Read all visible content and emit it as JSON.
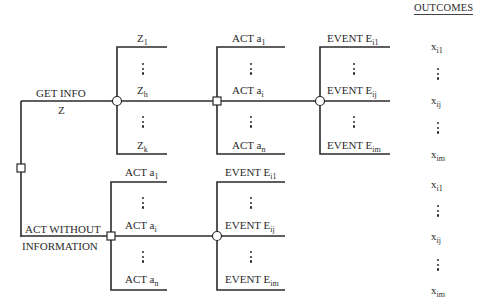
{
  "diagram": {
    "type": "decision-tree",
    "header": {
      "outcomes": "OUTCOMES"
    },
    "root_branches": {
      "get_info": {
        "label": "GET INFO",
        "sublabel": "Z"
      },
      "act_without_info": {
        "line1": "ACT WITHOUT",
        "line2": "INFORMATION"
      }
    },
    "info_outcomes": [
      {
        "base": "Z",
        "sub": "1"
      },
      {
        "base": "Z",
        "sub": "h"
      },
      {
        "base": "Z",
        "sub": "k"
      }
    ],
    "acts_top": [
      {
        "base": "ACT a",
        "sub": "1"
      },
      {
        "base": "ACT a",
        "sub": "i"
      },
      {
        "base": "ACT a",
        "sub": "n"
      }
    ],
    "events_top": [
      {
        "base": "EVENT E",
        "sub": "i1"
      },
      {
        "base": "EVENT E",
        "sub": "ij"
      },
      {
        "base": "EVENT E",
        "sub": "im"
      }
    ],
    "outcomes_top": [
      {
        "base": "x",
        "sub": "i1"
      },
      {
        "base": "x",
        "sub": "ij"
      },
      {
        "base": "x",
        "sub": "im"
      }
    ],
    "acts_bottom": [
      {
        "base": "ACT a",
        "sub": "1"
      },
      {
        "base": "ACT a",
        "sub": "i"
      },
      {
        "base": "ACT a",
        "sub": "n"
      }
    ],
    "events_bottom": [
      {
        "base": "EVENT E",
        "sub": "i1"
      },
      {
        "base": "EVENT E",
        "sub": "ij"
      },
      {
        "base": "EVENT E",
        "sub": "im"
      }
    ],
    "outcomes_bottom": [
      {
        "base": "x",
        "sub": "i1"
      },
      {
        "base": "x",
        "sub": "ij"
      },
      {
        "base": "x",
        "sub": "im"
      }
    ],
    "colors": {
      "line": "#2a2a2a",
      "node_fill": "#ffffff",
      "background": "#ffffff"
    }
  }
}
